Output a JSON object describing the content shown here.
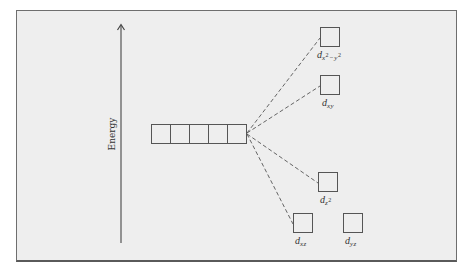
{
  "diagram": {
    "type": "crystal-field-splitting",
    "axis": {
      "label": "Energy",
      "direction": "up"
    },
    "degenerate_set": {
      "box_count": 5,
      "description": "five degenerate d orbitals"
    },
    "split_orbitals": [
      {
        "id": "dx2-y2",
        "base": "d",
        "sub": "x",
        "sup1": "2",
        "mid": "−y",
        "sup2": "2",
        "rank": 1
      },
      {
        "id": "dxy",
        "base": "d",
        "sub": "xy",
        "rank": 2
      },
      {
        "id": "dz2",
        "base": "d",
        "sub": "z",
        "sup1": "2",
        "rank": 3
      },
      {
        "id": "dxz",
        "base": "d",
        "sub": "xz",
        "rank": 4
      },
      {
        "id": "dyz",
        "base": "d",
        "sub": "yz",
        "rank": 4
      }
    ],
    "colors": {
      "background": "#eeeeee",
      "lines": "#444444",
      "frame": "#6e6e6e"
    }
  }
}
